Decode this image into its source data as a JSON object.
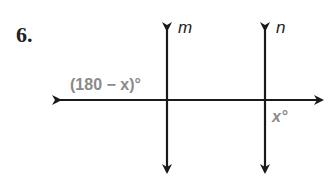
{
  "problem": {
    "number": "6.",
    "lines": {
      "m": "m",
      "n": "n"
    },
    "angles": {
      "left_angle": "(180 − x)°",
      "right_angle": "x°"
    },
    "colors": {
      "line": "#1a1a1a",
      "angle_label": "#8a8a8a"
    }
  }
}
